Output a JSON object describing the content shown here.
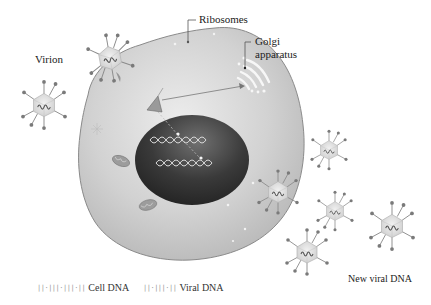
{
  "diagram": {
    "type": "viral replication in a host cell",
    "labels": {
      "ribosomes": "Ribosomes",
      "golgi_line1": "Golgi",
      "golgi_line2": "apparatus",
      "virion": "Virion",
      "new_viral_dna": "New viral DNA"
    },
    "legend": [
      {
        "glyph": "||·|||·|||·||",
        "label": "Cell DNA",
        "icon": "cell-dna-icon"
      },
      {
        "glyph": "||·|||·||",
        "label": "Viral DNA",
        "icon": "viral-dna-icon"
      }
    ],
    "colors": {
      "cytoplasm": "#cfcfcf",
      "cell_outline": "#8a8a8a",
      "nucleus_dark": "#2e2e2e",
      "nucleus_light": "#6a6a6a",
      "dna_strand": "#d9d9d9",
      "virion_capsid": "#e2e2e2",
      "spike": "#777777",
      "text": "#222222"
    },
    "components": [
      "cell membrane",
      "cytoplasm",
      "nucleus",
      "cell DNA strands",
      "mitochondria",
      "golgi apparatus",
      "attached virion",
      "free virions",
      "new virions"
    ]
  }
}
